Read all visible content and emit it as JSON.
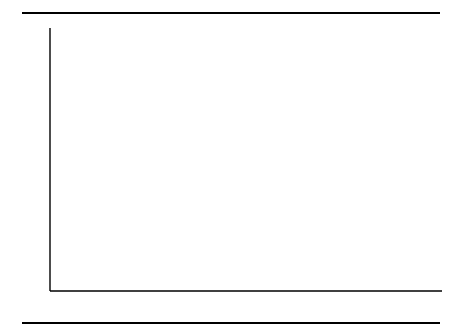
{
  "figure": {
    "ylabel": "Government Share %",
    "top_rule": "rule",
    "bottom_rule": "rule"
  },
  "chart_data": {
    "type": "line",
    "title": "",
    "xlabel": "",
    "ylabel": "Government Share %",
    "xlim": [
      1900,
      1992
    ],
    "ylim": [
      0,
      30
    ],
    "xticks": [
      1900,
      1910,
      1920,
      1930,
      1940,
      1950,
      1960,
      1970,
      1980,
      1990
    ],
    "xtick_labels": [
      "1900",
      "1910",
      "1920",
      "1930",
      "1940",
      "1950",
      "1960",
      "1970",
      "1980",
      "1990"
    ],
    "yticks": [
      5,
      10,
      15,
      20,
      25,
      30
    ],
    "ytick_labels": [
      "5",
      "10",
      "15",
      "20",
      "25",
      "30"
    ],
    "grid": false,
    "legend": "annotations",
    "series": [
      {
        "name": "Government share of land",
        "style": "solid",
        "points": [
          {
            "x": 1900,
            "y": 13.0
          },
          {
            "x": 1929,
            "y": 13.0
          },
          {
            "x": 1940,
            "y": 15.6
          },
          {
            "x": 1950,
            "y": 18.5
          },
          {
            "x": 1958,
            "y": 13.4
          }
        ]
      },
      {
        "name": "Government share of structures",
        "style": "dotted",
        "points": [
          {
            "x": 1900,
            "y": 6.2
          },
          {
            "x": 1910,
            "y": 7.6
          },
          {
            "x": 1920,
            "y": 9.4
          },
          {
            "x": 1929,
            "y": 11.7
          },
          {
            "x": 1940,
            "y": 15.6
          },
          {
            "x": 1950,
            "y": 19.4
          },
          {
            "x": 1955,
            "y": 20.3
          },
          {
            "x": 1960,
            "y": 20.8
          },
          {
            "x": 1965,
            "y": 20.6
          },
          {
            "x": 1970,
            "y": 19.6
          },
          {
            "x": 1975,
            "y": 18.6
          },
          {
            "x": 1980,
            "y": 17.4
          },
          {
            "x": 1985,
            "y": 16.2
          },
          {
            "x": 1990,
            "y": 15.4
          }
        ]
      },
      {
        "name": "Government share of purchases, GNP",
        "style": "long-dash",
        "points": [
          {
            "x": 1929,
            "y": 9.2
          },
          {
            "x": 1940,
            "y": 14.3
          },
          {
            "x": 1950,
            "y": 13.5
          },
          {
            "x": 1960,
            "y": 19.8
          },
          {
            "x": 1965,
            "y": 20.5
          },
          {
            "x": 1970,
            "y": 23.0
          },
          {
            "x": 1975,
            "y": 21.7
          },
          {
            "x": 1980,
            "y": 20.2
          },
          {
            "x": 1985,
            "y": 19.0
          },
          {
            "x": 1990,
            "y": 20.1
          }
        ]
      },
      {
        "name": "Government share of national income",
        "style": "solid",
        "points": [
          {
            "x": 1900,
            "y": 1.8
          },
          {
            "x": 1920,
            "y": 4.6
          },
          {
            "x": 1929,
            "y": 6.2
          },
          {
            "x": 1940,
            "y": 8.0
          },
          {
            "x": 1950,
            "y": 10.1
          },
          {
            "x": 1960,
            "y": 12.2
          },
          {
            "x": 1965,
            "y": 13.4
          },
          {
            "x": 1970,
            "y": 15.8
          },
          {
            "x": 1975,
            "y": 16.1
          },
          {
            "x": 1980,
            "y": 16.6
          },
          {
            "x": 1985,
            "y": 15.4
          },
          {
            "x": 1990,
            "y": 15.4
          }
        ]
      },
      {
        "name": "Government share of employment",
        "style": "dash",
        "points": [
          {
            "x": 1929,
            "y": 6.2
          },
          {
            "x": 1940,
            "y": 11.3
          },
          {
            "x": 1950,
            "y": 11.0
          },
          {
            "x": 1960,
            "y": 12.4
          },
          {
            "x": 1965,
            "y": 13.6
          },
          {
            "x": 1970,
            "y": 15.9
          },
          {
            "x": 1975,
            "y": 16.0
          },
          {
            "x": 1980,
            "y": 16.5
          },
          {
            "x": 1985,
            "y": 13.4
          },
          {
            "x": 1990,
            "y": 15.1
          }
        ]
      }
    ],
    "annotations": [
      {
        "id": "land",
        "text": "Government share of land"
      },
      {
        "id": "structures",
        "text": "Government\nshare of\nstructures"
      },
      {
        "id": "gnp",
        "text": "Government share\nof purchases,  GNP"
      },
      {
        "id": "income",
        "text": "Government share\nof national income"
      },
      {
        "id": "employment",
        "text": "Government share\nof employment"
      }
    ]
  }
}
